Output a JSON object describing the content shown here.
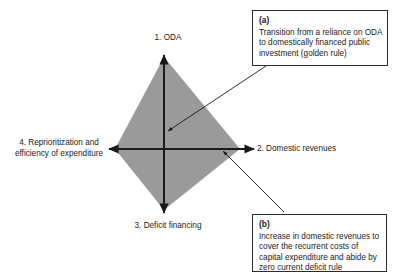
{
  "figure": {
    "type": "kite-quadrant-diagram",
    "background_color": "#ffffff",
    "shape_fill_color": "#9a9a9a",
    "line_color": "#1a1a1a",
    "box_border_color": "#2b2b2b"
  },
  "axes": [
    {
      "id": "axis-up",
      "number": "1.",
      "label": "1. ODA",
      "direction": "up",
      "arrow": "outward"
    },
    {
      "id": "axis-right",
      "number": "2.",
      "label": "2. Domestic revenues",
      "direction": "right",
      "arrow": "outward"
    },
    {
      "id": "axis-down",
      "number": "3.",
      "label": "3. Deficit financing",
      "direction": "down",
      "arrow": "outward"
    },
    {
      "id": "axis-left",
      "number": "4.",
      "label_line1": "4. Reprioritization and",
      "label_line2": "efficiency of expenditure",
      "direction": "left",
      "arrow": "outward"
    }
  ],
  "callouts": [
    {
      "id": "a",
      "tag": "(a)",
      "text": "Transition from a reliance on ODA to domestically financed public investment (golden rule)",
      "points_to": "centre of diagram (ODA axis)"
    },
    {
      "id": "b",
      "tag": "(b)",
      "text": "Increase in domestic revenues to cover the recurrent costs of capital expenditure and abide by zero current deficit rule",
      "points_to": "domestic revenues axis"
    }
  ]
}
